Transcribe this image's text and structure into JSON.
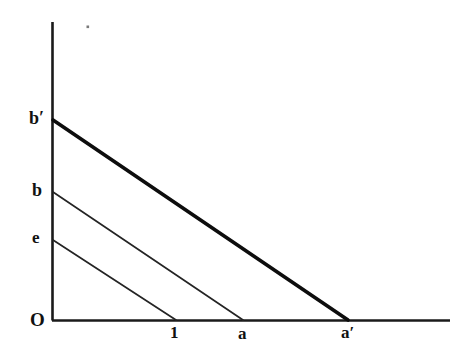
{
  "figure": {
    "background_color": "#ffffff",
    "ink_color": "#111111",
    "axis_labels": {
      "origin": "O",
      "y_intercept_high": "b′",
      "y_intercept_mid": "b",
      "y_intercept_low": "e",
      "x_intercept_low": "1",
      "x_intercept_mid": "a",
      "x_intercept_high": "a′"
    }
  },
  "chart_data": {
    "type": "line",
    "title": "",
    "subtitle": "",
    "xlabel": "",
    "ylabel": "",
    "xlim": [
      0,
      3.35
    ],
    "ylim": [
      0,
      3.0
    ],
    "grid": false,
    "legend": "none",
    "axes": {
      "y_axis": {
        "x_px": 52,
        "y_top_px": 22,
        "y_bottom_px": 320,
        "stroke_width_px": 2.4
      },
      "x_axis": {
        "y_px": 320,
        "x_left_px": 52,
        "x_right_px": 450,
        "stroke_width_px": 2.4
      }
    },
    "tick_labels": {
      "x": [
        "1",
        "a",
        "a′"
      ],
      "y": [
        "O",
        "e",
        "b",
        "b′"
      ]
    },
    "annotations": [
      {
        "text": "O",
        "role": "origin-label",
        "x_px": 36,
        "y_px": 321
      },
      {
        "text": "b′",
        "role": "y-intercept-label",
        "x_px": 37,
        "y_px": 118
      },
      {
        "text": "b",
        "role": "y-intercept-label",
        "x_px": 38,
        "y_px": 190
      },
      {
        "text": "e",
        "role": "y-intercept-label",
        "x_px": 38,
        "y_px": 238
      },
      {
        "text": "1",
        "role": "x-intercept-label",
        "x_px": 175,
        "y_px": 333
      },
      {
        "text": "a",
        "role": "x-intercept-label",
        "x_px": 244,
        "y_px": 334
      },
      {
        "text": "a′",
        "role": "x-intercept-label",
        "x_px": 349,
        "y_px": 333
      }
    ],
    "series": [
      {
        "name": "b′ a′",
        "emphasis": "bold",
        "stroke_width_px": 3.6,
        "color": "#0d0d0d",
        "y_intercept_label": "b′",
        "x_intercept_label": "a′",
        "points_px": [
          [
            53,
            120
          ],
          [
            348,
            320
          ]
        ],
        "points_data": [
          [
            0,
            2.0
          ],
          [
            2.48,
            0
          ]
        ]
      },
      {
        "name": "b a",
        "emphasis": "normal",
        "stroke_width_px": 1.7,
        "color": "#242424",
        "y_intercept_label": "b",
        "x_intercept_label": "a",
        "points_px": [
          [
            53,
            192
          ],
          [
            243,
            320
          ]
        ],
        "points_data": [
          [
            0,
            1.28
          ],
          [
            1.6,
            0
          ]
        ]
      },
      {
        "name": "e 1",
        "emphasis": "normal",
        "stroke_width_px": 1.7,
        "color": "#242424",
        "y_intercept_label": "e",
        "x_intercept_label": "1",
        "points_px": [
          [
            53,
            240
          ],
          [
            176,
            320
          ]
        ],
        "points_data": [
          [
            0,
            0.8
          ],
          [
            1.0,
            0
          ]
        ]
      }
    ]
  }
}
